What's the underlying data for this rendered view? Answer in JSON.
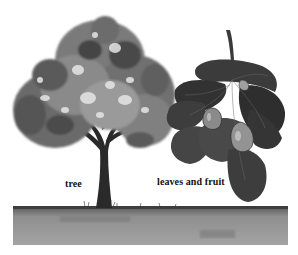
{
  "illustration": {
    "subject": "fig tree",
    "labels": {
      "tree": "tree",
      "leaves_and_fruit": "leaves and fruit"
    },
    "palette": {
      "background": "#ffffff",
      "canopy_dark": "#3a3a3a",
      "canopy_mid": "#7a7a7a",
      "canopy_light": "#b8b8b8",
      "canopy_highlight": "#e2e2e2",
      "trunk": "#2a2a2a",
      "leaf_dark": "#2e2e2e",
      "leaf_mid": "#555555",
      "fig_fruit": "#8a8a8a",
      "ground_top": "#4a4a4a",
      "ground": "#8c8c8c",
      "ground_light": "#a6a6a6"
    }
  }
}
